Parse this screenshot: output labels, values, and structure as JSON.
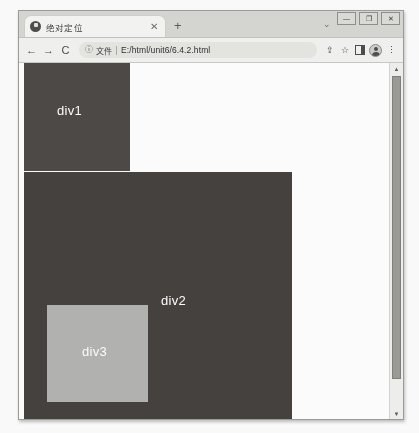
{
  "window": {
    "controls": [
      {
        "name": "minimize",
        "glyph": "—"
      },
      {
        "name": "maximize",
        "glyph": "❐"
      },
      {
        "name": "close",
        "glyph": "✕"
      }
    ]
  },
  "tabstrip": {
    "tab_title": "绝对定位",
    "tab_favicon": "globe-icon",
    "tab_close": "✕",
    "new_tab": "+",
    "tab_list_chevron": "⌄"
  },
  "toolbar": {
    "back": "←",
    "forward": "→",
    "reload": "C",
    "site_info_icon": "ⓘ",
    "scheme_label": "文件",
    "url": "E:/html/unit6/6.4.2.html",
    "share": "⇪",
    "bookmark": "☆",
    "side_panel": "panel-icon",
    "profile": "avatar-icon",
    "menu": "⋮"
  },
  "page": {
    "blocks": [
      {
        "id": "div1",
        "label": "div1",
        "color": "#4a4745"
      },
      {
        "id": "div2",
        "label": "div2",
        "color": "#433f3d"
      },
      {
        "id": "div3",
        "label": "div3",
        "color": "#b3b3b0"
      }
    ],
    "scrollbar": {
      "up_arrow": "▲",
      "down_arrow": "▼"
    }
  }
}
